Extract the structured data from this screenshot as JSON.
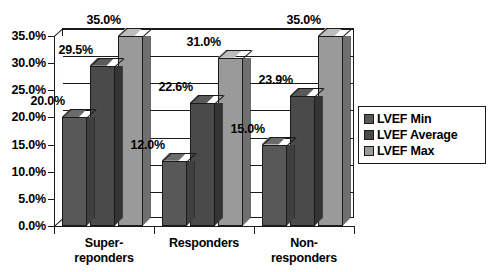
{
  "chart_data": {
    "type": "bar",
    "title": "",
    "subtitle": "",
    "xlabel": "",
    "ylabel": "",
    "ylim": [
      0,
      35
    ],
    "ytick_labels": [
      "0.0%",
      "5.0%",
      "10.0%",
      "15.0%",
      "20.0%",
      "25.0%",
      "30.0%",
      "35.0%"
    ],
    "ytick_values": [
      0,
      5,
      10,
      15,
      20,
      25,
      30,
      35
    ],
    "grid": true,
    "legend_position": "right",
    "three_d": true,
    "categories": [
      "Super-\nreponders",
      "Responders",
      "Non-\nresponders"
    ],
    "series": [
      {
        "name": "LVEF Min",
        "color": "#585858",
        "values": [
          20.0,
          12.0,
          15.0
        ],
        "labels": [
          "20.0%",
          "12.0%",
          "15.0%"
        ]
      },
      {
        "name": "LVEF Average",
        "color": "#4a4a4a",
        "values": [
          29.5,
          22.6,
          23.9
        ],
        "labels": [
          "29.5%",
          "22.6%",
          "23.9%"
        ]
      },
      {
        "name": "LVEF Max",
        "color": "#9a9a9a",
        "values": [
          35.0,
          31.0,
          35.0
        ],
        "labels": [
          "35.0%",
          "31.0%",
          "35.0%"
        ]
      }
    ]
  },
  "legend": {
    "items": [
      {
        "label": "LVEF Min",
        "color": "#585858"
      },
      {
        "label": "LVEF Average",
        "color": "#4a4a4a"
      },
      {
        "label": "LVEF Max",
        "color": "#9a9a9a"
      }
    ]
  },
  "axis": {
    "y_labels": [
      "35.0%",
      "30.0%",
      "25.0%",
      "20.0%",
      "15.0%",
      "10.0%",
      "5.0%",
      "0.0%"
    ],
    "x_labels": [
      "Super-\nreponders",
      "Responders",
      "Non-\nresponders"
    ]
  }
}
